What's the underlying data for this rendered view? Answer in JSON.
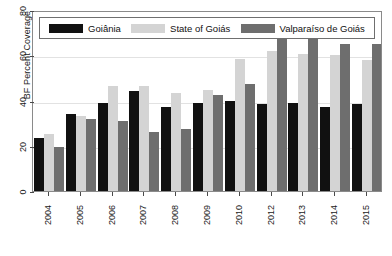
{
  "chart_data": {
    "type": "bar",
    "title": "",
    "xlabel": "",
    "ylabel": "BF Percent Coverage",
    "ylim": [
      0,
      80
    ],
    "yticks": [
      0,
      20,
      40,
      60,
      80
    ],
    "grid": true,
    "legend_position": "top",
    "categories": [
      "2004",
      "2005",
      "2006",
      "2007",
      "2008",
      "2009",
      "2010",
      "2012",
      "2013",
      "2014",
      "2015"
    ],
    "series": [
      {
        "name": "Goiânia",
        "color": "#111111",
        "values": [
          23.5,
          34.0,
          39.0,
          44.0,
          37.0,
          39.0,
          40.0,
          38.5,
          39.0,
          37.0,
          38.5
        ]
      },
      {
        "name": "State of Goiás",
        "color": "#d4d4d4",
        "values": [
          25.0,
          33.0,
          46.5,
          46.5,
          43.5,
          44.5,
          58.5,
          62.0,
          60.5,
          60.0,
          58.0
        ]
      },
      {
        "name": "Valparaíso de Goiás",
        "color": "#6e6e6e",
        "values": [
          19.5,
          32.0,
          31.0,
          26.0,
          27.5,
          42.5,
          47.5,
          69.5,
          70.5,
          65.0,
          65.0
        ]
      }
    ]
  },
  "axes": {
    "y_label_text": "BF Percent Coverage",
    "y_tick_labels": [
      "0",
      "20",
      "40",
      "60",
      "80"
    ],
    "x_tick_labels": [
      "2004",
      "2005",
      "2006",
      "2007",
      "2008",
      "2009",
      "2010",
      "2012",
      "2013",
      "2014",
      "2015"
    ]
  },
  "legend": {
    "entries": [
      {
        "label": "Goiânia",
        "color": "#111111"
      },
      {
        "label": "State of Goiás",
        "color": "#d4d4d4"
      },
      {
        "label": "Valparaíso de Goiás",
        "color": "#6e6e6e"
      }
    ]
  }
}
